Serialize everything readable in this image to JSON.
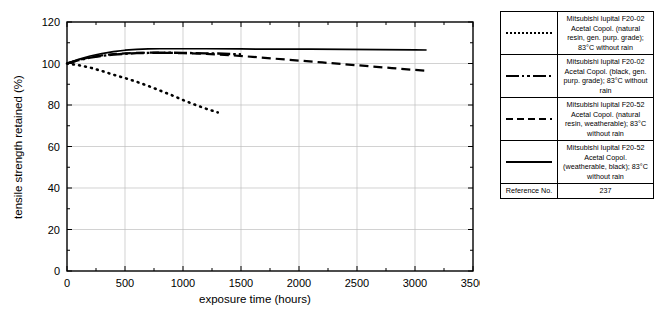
{
  "title_fragment": "property",
  "chart_data": {
    "type": "line",
    "title": "",
    "xlabel": "exposure time (hours)",
    "ylabel": "tensile strength retained (%)",
    "xlim": [
      0,
      3500
    ],
    "ylim": [
      0,
      120
    ],
    "xticks": [
      0,
      500,
      1000,
      1500,
      2000,
      2500,
      3000,
      3500
    ],
    "yticks": [
      0,
      20,
      40,
      60,
      80,
      100,
      120
    ],
    "x_minor_tick_step": 250,
    "y_minor_tick_step": 10,
    "grid": "both-light-gray",
    "legend_position": "right-table",
    "series": [
      {
        "name": "Mitsubishi Iupital F20-02 Acetal Copol. (natural resin, gen. purp. grade); 83°C without rain",
        "style": "dotted",
        "x": [
          0,
          100,
          200,
          300,
          400,
          500,
          600,
          700,
          800,
          900,
          1000,
          1100,
          1200,
          1300
        ],
        "y": [
          100,
          99.2,
          98.0,
          96.4,
          94.6,
          93.0,
          91.2,
          89.2,
          87.0,
          84.8,
          82.4,
          80.2,
          78.2,
          76.4
        ]
      },
      {
        "name": "Mitsubishi Iupital F20-02 Acetal Copol. (black, gen. purp. grade); 83°C without rain",
        "style": "dash-dot",
        "x": [
          0,
          100,
          200,
          300,
          400,
          500,
          600,
          700,
          800,
          900,
          1000,
          1100,
          1200,
          1300,
          1400,
          1500
        ],
        "y": [
          100,
          101.6,
          102.8,
          103.7,
          104.3,
          104.7,
          105.0,
          105.1,
          105.2,
          105.2,
          105.1,
          105.0,
          104.9,
          104.8,
          104.6,
          104.4
        ]
      },
      {
        "name": "Mitsubishi Iupital F20-52 Acetal Copol. (natural resin, weatherable); 83°C without rain",
        "style": "dashed",
        "x": [
          0,
          100,
          200,
          300,
          400,
          500,
          600,
          700,
          800,
          900,
          1000,
          1200,
          1400,
          1600,
          1800,
          2000,
          2200,
          2400,
          2600,
          2800,
          3000,
          3100
        ],
        "y": [
          100,
          101.7,
          103.0,
          103.9,
          104.5,
          104.9,
          105.1,
          105.2,
          105.2,
          105.1,
          105.0,
          104.6,
          104.0,
          103.2,
          102.3,
          101.4,
          100.5,
          99.6,
          98.7,
          97.8,
          96.9,
          96.5
        ]
      },
      {
        "name": "Mitsubishi Iupital F20-52 Acetal Copol. (weatherable, black); 83°C without rain",
        "style": "solid",
        "x": [
          0,
          100,
          200,
          300,
          400,
          500,
          600,
          700,
          800,
          1000,
          1200,
          1500,
          1800,
          2100,
          2400,
          2700,
          3000,
          3100
        ],
        "y": [
          100,
          102.0,
          103.6,
          104.8,
          105.7,
          106.4,
          106.8,
          107.0,
          107.1,
          107.1,
          107.1,
          107.0,
          106.9,
          106.9,
          106.8,
          106.7,
          106.6,
          106.5
        ]
      }
    ]
  },
  "legend": {
    "rows": [
      {
        "style": "dotted",
        "lines": [
          "Mitsubishi Iupital F20-02",
          "Acetal Copol. (natural",
          "resin, gen. purp. grade);",
          "83°C without rain"
        ]
      },
      {
        "style": "dash-dot",
        "lines": [
          "Mitsubishi Iupital F20-02",
          "Acetal Copol. (black, gen.",
          "purp. grade); 83°C without",
          "rain"
        ]
      },
      {
        "style": "dashed",
        "lines": [
          "Mitsubishi Iupital F20-52",
          "Acetal Copol. (natural",
          "resin, weatherable); 83°C",
          "without rain"
        ]
      },
      {
        "style": "solid",
        "lines": [
          "Mitsubishi Iupital F20-52",
          "Acetal Copol.",
          "(weatherable, black); 83°C",
          "without rain"
        ]
      }
    ],
    "reference_label": "Reference No.",
    "reference_value": "237"
  },
  "colors": {
    "line": "#000000",
    "grid": "#bfbfbf",
    "axis": "#000000",
    "background": "#ffffff"
  }
}
